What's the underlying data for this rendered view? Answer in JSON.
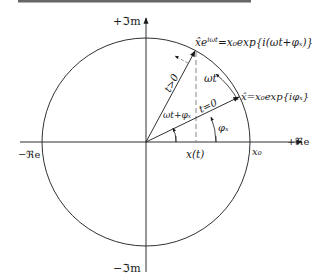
{
  "diagram": {
    "type": "complex-plane phasor diagram",
    "axes": {
      "pos_imag": "+ℑm",
      "neg_imag": "−ℑm",
      "pos_real": "+ℜe",
      "neg_real": "−ℜe"
    },
    "labels": {
      "rotating_phasor": "x̂e",
      "rotating_phasor_sup": "iωt",
      "rotating_phasor_rhs": "=x₀exp{i(ωt+φₓ)}",
      "initial_phasor": "x̂=x₀exp{iφₓ}",
      "t_gt_0": "t>0",
      "t_eq_0": "t=0",
      "omega_t": "ωt",
      "omega_t_plus_phi": "ωt+φₓ",
      "phi_x": "φₓ",
      "x_of_t": "x(t)",
      "x0": "x₀"
    },
    "colors": {
      "line": "#1a1a1a",
      "dashed": "#777777",
      "top_rule": "#666666"
    }
  }
}
